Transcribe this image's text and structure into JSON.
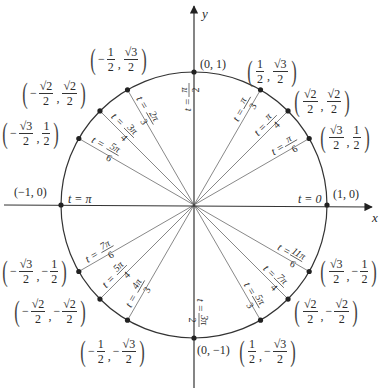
{
  "diagram": {
    "axes": {
      "x_label": "x",
      "y_label": "y"
    },
    "geometry": {
      "cx": 194,
      "cy": 205,
      "r": 133
    },
    "colors": {
      "line": "#333333",
      "ray": "#6a6a6a",
      "point": "#222222"
    },
    "points": [
      {
        "angle_deg": 0,
        "t_label": "t = 0",
        "coord_label": "(1, 0)",
        "coord": {
          "type": "simple",
          "text": "(1, 0)"
        }
      },
      {
        "angle_deg": 30,
        "t_label": "t = π/6",
        "coord_label": "(√3/2, 1/2)",
        "coord": {
          "type": "frac",
          "x": {
            "sign": "",
            "num": "√3",
            "den": "2"
          },
          "y": {
            "sign": "",
            "num": "1",
            "den": "2"
          }
        }
      },
      {
        "angle_deg": 45,
        "t_label": "t = π/4",
        "coord_label": "(√2/2, √2/2)",
        "coord": {
          "type": "frac",
          "x": {
            "sign": "",
            "num": "√2",
            "den": "2"
          },
          "y": {
            "sign": "",
            "num": "√2",
            "den": "2"
          }
        }
      },
      {
        "angle_deg": 60,
        "t_label": "t = π/3",
        "coord_label": "(1/2, √3/2)",
        "coord": {
          "type": "frac",
          "x": {
            "sign": "",
            "num": "1",
            "den": "2"
          },
          "y": {
            "sign": "",
            "num": "√3",
            "den": "2"
          }
        }
      },
      {
        "angle_deg": 90,
        "t_label": "t = π/2",
        "coord_label": "(0, 1)",
        "coord": {
          "type": "simple",
          "text": "(0, 1)"
        }
      },
      {
        "angle_deg": 120,
        "t_label": "t = 2π/3",
        "coord_label": "(−1/2, √3/2)",
        "coord": {
          "type": "frac",
          "x": {
            "sign": "−",
            "num": "1",
            "den": "2"
          },
          "y": {
            "sign": "",
            "num": "√3",
            "den": "2"
          }
        }
      },
      {
        "angle_deg": 135,
        "t_label": "t = 3π/4",
        "coord_label": "(−√2/2, √2/2)",
        "coord": {
          "type": "frac",
          "x": {
            "sign": "−",
            "num": "√2",
            "den": "2"
          },
          "y": {
            "sign": "",
            "num": "√2",
            "den": "2"
          }
        }
      },
      {
        "angle_deg": 150,
        "t_label": "t = 5π/6",
        "coord_label": "(−√3/2, 1/2)",
        "coord": {
          "type": "frac",
          "x": {
            "sign": "−",
            "num": "√3",
            "den": "2"
          },
          "y": {
            "sign": "",
            "num": "1",
            "den": "2"
          }
        }
      },
      {
        "angle_deg": 180,
        "t_label": "t = π",
        "coord_label": "(−1, 0)",
        "coord": {
          "type": "simple",
          "text": "(−1, 0)"
        }
      },
      {
        "angle_deg": 210,
        "t_label": "t = 7π/6",
        "coord_label": "(−√3/2, −1/2)",
        "coord": {
          "type": "frac",
          "x": {
            "sign": "−",
            "num": "√3",
            "den": "2"
          },
          "y": {
            "sign": "−",
            "num": "1",
            "den": "2"
          }
        }
      },
      {
        "angle_deg": 225,
        "t_label": "t = 5π/4",
        "coord_label": "(−√2/2, −√2/2)",
        "coord": {
          "type": "frac",
          "x": {
            "sign": "−",
            "num": "√2",
            "den": "2"
          },
          "y": {
            "sign": "−",
            "num": "√2",
            "den": "2"
          }
        }
      },
      {
        "angle_deg": 240,
        "t_label": "t = 4π/3",
        "coord_label": "(−1/2, −√3/2)",
        "coord": {
          "type": "frac",
          "x": {
            "sign": "−",
            "num": "1",
            "den": "2"
          },
          "y": {
            "sign": "−",
            "num": "√3",
            "den": "2"
          }
        }
      },
      {
        "angle_deg": 270,
        "t_label": "t = 3π/2",
        "coord_label": "(0, −1)",
        "coord": {
          "type": "simple",
          "text": "(0, −1)"
        }
      },
      {
        "angle_deg": 300,
        "t_label": "t = 5π/3",
        "coord_label": "(1/2, −√3/2)",
        "coord": {
          "type": "frac",
          "x": {
            "sign": "",
            "num": "1",
            "den": "2"
          },
          "y": {
            "sign": "−",
            "num": "√3",
            "den": "2"
          }
        }
      },
      {
        "angle_deg": 315,
        "t_label": "t = 7π/4",
        "coord_label": "(√2/2, −√2/2)",
        "coord": {
          "type": "frac",
          "x": {
            "sign": "",
            "num": "√2",
            "den": "2"
          },
          "y": {
            "sign": "−",
            "num": "√2",
            "den": "2"
          }
        }
      },
      {
        "angle_deg": 330,
        "t_label": "t = 11π/6",
        "coord_label": "(√3/2, −1/2)",
        "coord": {
          "type": "frac",
          "x": {
            "sign": "",
            "num": "√3",
            "den": "2"
          },
          "y": {
            "sign": "−",
            "num": "1",
            "den": "2"
          }
        }
      }
    ],
    "coord_positions": {
      "0": {
        "left": 333,
        "top": 188
      },
      "30": {
        "left": 318,
        "top": 122
      },
      "45": {
        "left": 292,
        "top": 86
      },
      "60": {
        "left": 245,
        "top": 56
      },
      "90": {
        "left": 200,
        "top": 58
      },
      "120": {
        "left": 88,
        "top": 44
      },
      "135": {
        "left": 20,
        "top": 78
      },
      "150": {
        "left": 0,
        "top": 118
      },
      "180": {
        "left": 14,
        "top": 186
      },
      "210": {
        "left": 0,
        "top": 256
      },
      "225": {
        "left": 12,
        "top": 296
      },
      "240": {
        "left": 78,
        "top": 336
      },
      "270": {
        "left": 197,
        "top": 344
      },
      "300": {
        "left": 237,
        "top": 336
      },
      "315": {
        "left": 292,
        "top": 296
      },
      "330": {
        "left": 318,
        "top": 256
      }
    },
    "t_positions": {
      "0": {
        "x": 298,
        "y": 203,
        "rot": 0,
        "frac": false,
        "text": "t = 0"
      },
      "180": {
        "x": 68,
        "y": 203,
        "rot": 0,
        "frac": false,
        "text": "t = π"
      }
    }
  }
}
